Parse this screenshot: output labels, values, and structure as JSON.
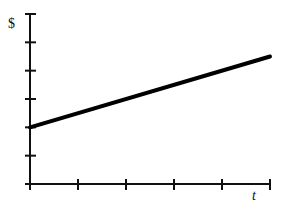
{
  "chart_data": {
    "type": "line",
    "title": "",
    "xlabel": "t",
    "ylabel": "$",
    "x_ticks": 5,
    "y_ticks": 6,
    "xlim": [
      0,
      5
    ],
    "ylim": [
      0,
      6
    ],
    "grid": false,
    "legend": null,
    "series": [
      {
        "name": "linear",
        "x": [
          0,
          5
        ],
        "values": [
          2,
          4.5
        ]
      }
    ],
    "annotations": []
  },
  "colors": {
    "line": "#000000",
    "axis": "#111111",
    "background": "#ffffff"
  }
}
